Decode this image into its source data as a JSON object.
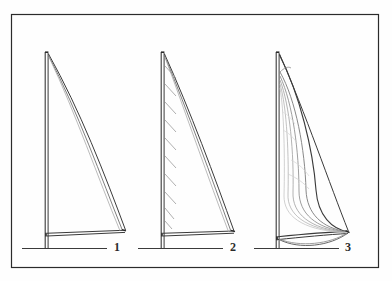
{
  "figure": {
    "caption": "",
    "background_color": "#fefefe",
    "frame": {
      "name": "figure-border",
      "color": "#2b2b2b",
      "stroke_width": 1.2,
      "x": 11,
      "y": 14,
      "width": 368,
      "height": 254
    },
    "line_color": "#3a3a3a",
    "light_line_color": "#8d8d8d",
    "faint_line_color": "#b8b8b8",
    "panels": [
      {
        "id": "panel-1",
        "label": "1",
        "description": "Flat sail: mast with straight luff, straight leech and straight foot, minimal draft",
        "mast_x": 46,
        "mast_top_y": 52,
        "mast_bottom_y": 248,
        "boom_y": 233,
        "clew_x": 125,
        "clew_y": 230,
        "deck_x1": 22,
        "deck_x2": 107,
        "deck_y": 248,
        "luff_tick_count": 0,
        "draft_curves": 2,
        "label_x": 114,
        "label_y": 241
      },
      {
        "id": "panel-2",
        "label": "2",
        "description": "Sail with luff rope slides / hanks shown as short diagonal ticks along the mast",
        "mast_x": 162,
        "mast_top_y": 52,
        "mast_bottom_y": 248,
        "boom_y": 233,
        "clew_x": 234,
        "clew_y": 231,
        "deck_x1": 138,
        "deck_x2": 223,
        "deck_y": 248,
        "luff_tick_count": 10,
        "draft_curves": 2,
        "label_x": 230,
        "label_y": 241
      },
      {
        "id": "panel-3",
        "label": "3",
        "description": "Full bellied sail: deeply curved leech and foot showing maximum draft, several nested draft curves",
        "mast_x": 277,
        "mast_top_y": 52,
        "mast_bottom_y": 248,
        "boom_y": 238,
        "clew_x": 348,
        "clew_y": 232,
        "deck_x1": 254,
        "deck_x2": 339,
        "deck_y": 248,
        "luff_tick_count": 0,
        "draft_curves": 6,
        "label_x": 345,
        "label_y": 241
      }
    ]
  }
}
